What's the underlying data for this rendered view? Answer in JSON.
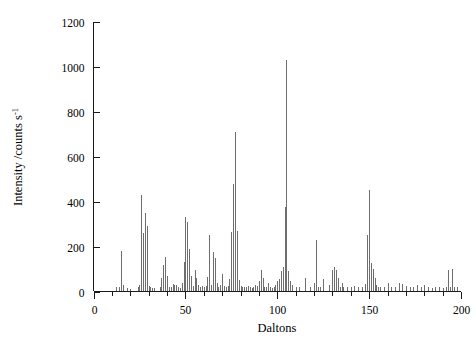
{
  "chart_data": {
    "type": "bar",
    "title": "",
    "subtitle": "",
    "xlabel": "Daltons",
    "ylabel": "Intensity /counts s",
    "ylabel_sup": "-1",
    "xlim": [
      0,
      200
    ],
    "ylim": [
      0,
      1200
    ],
    "xticks": [
      0,
      50,
      100,
      150,
      200
    ],
    "xtick_labels": [
      "0",
      "50",
      "100",
      "150",
      "200"
    ],
    "yticks": [
      0,
      200,
      400,
      600,
      800,
      1000,
      1200
    ],
    "ytick_labels": [
      "0",
      "200",
      "400",
      "600",
      "800",
      "1000",
      "1200"
    ],
    "x_minor_tick_interval": 10,
    "grid": false,
    "legend": false,
    "series_name": "mass spectrum",
    "peak_color": "#6e6e6e",
    "axis_color": "#1a1a1a",
    "x": [
      12,
      14,
      15,
      16,
      18,
      20,
      24,
      25,
      26,
      27,
      28,
      29,
      30,
      31,
      32,
      33,
      36,
      37,
      38,
      39,
      40,
      41,
      42,
      43,
      44,
      45,
      46,
      47,
      48,
      49,
      50,
      51,
      52,
      53,
      54,
      55,
      56,
      57,
      58,
      59,
      60,
      61,
      62,
      63,
      64,
      65,
      66,
      67,
      68,
      69,
      70,
      71,
      72,
      73,
      74,
      75,
      76,
      77,
      78,
      79,
      80,
      81,
      82,
      83,
      84,
      85,
      86,
      87,
      88,
      89,
      90,
      91,
      92,
      93,
      94,
      95,
      96,
      97,
      98,
      99,
      100,
      101,
      102,
      103,
      104,
      105,
      106,
      107,
      108,
      110,
      112,
      115,
      118,
      120,
      121,
      122,
      123,
      125,
      128,
      130,
      131,
      132,
      133,
      134,
      135,
      136,
      138,
      140,
      142,
      144,
      146,
      148,
      149,
      150,
      151,
      152,
      153,
      154,
      155,
      156,
      158,
      160,
      162,
      164,
      166,
      168,
      170,
      172,
      174,
      176,
      178,
      180,
      182,
      184,
      186,
      188,
      190,
      192,
      193,
      194,
      195,
      196,
      198
    ],
    "y": [
      18,
      22,
      180,
      30,
      14,
      12,
      20,
      28,
      430,
      260,
      350,
      290,
      24,
      18,
      16,
      14,
      22,
      60,
      120,
      155,
      70,
      20,
      18,
      35,
      30,
      28,
      22,
      14,
      38,
      130,
      330,
      310,
      190,
      70,
      26,
      95,
      58,
      30,
      22,
      24,
      20,
      26,
      64,
      250,
      30,
      175,
      150,
      40,
      22,
      28,
      80,
      24,
      20,
      26,
      55,
      265,
      480,
      710,
      270,
      50,
      24,
      22,
      18,
      20,
      26,
      22,
      16,
      18,
      30,
      24,
      45,
      95,
      60,
      18,
      22,
      40,
      20,
      16,
      22,
      30,
      45,
      55,
      90,
      110,
      375,
      1030,
      90,
      45,
      30,
      20,
      18,
      60,
      22,
      40,
      230,
      20,
      18,
      55,
      30,
      95,
      110,
      95,
      60,
      18,
      40,
      22,
      20,
      18,
      24,
      22,
      20,
      35,
      250,
      450,
      125,
      100,
      60,
      30,
      22,
      20,
      18,
      40,
      20,
      22,
      40,
      35,
      25,
      18,
      20,
      30,
      22,
      28,
      18,
      16,
      20,
      18,
      14,
      20,
      95,
      20,
      100,
      22,
      18
    ]
  }
}
